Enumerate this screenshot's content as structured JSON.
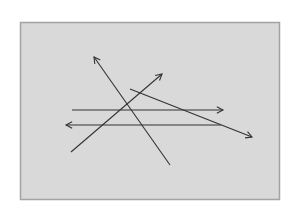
{
  "diagram": {
    "type": "arrows-on-panel",
    "panel": {
      "x": 20,
      "y": 22,
      "width": 259,
      "height": 177,
      "fill": "#d9d9d9",
      "stroke": "#a3a3a3"
    },
    "stroke_color": "#333333",
    "arrows": [
      {
        "id": "diagonal-up-left",
        "from": [
          170,
          165
        ],
        "to": [
          94,
          57
        ],
        "head": "end"
      },
      {
        "id": "diagonal-up-right",
        "from": [
          71,
          152
        ],
        "to": [
          162,
          74
        ],
        "head": "end"
      },
      {
        "id": "shallow-down-right",
        "from": [
          130,
          89
        ],
        "to": [
          252,
          137
        ],
        "head": "end"
      },
      {
        "id": "horizontal-right",
        "from": [
          72,
          110
        ],
        "to": [
          223,
          110
        ],
        "head": "end"
      },
      {
        "id": "horizontal-left",
        "from": [
          221,
          125
        ],
        "to": [
          66,
          125
        ],
        "head": "end"
      }
    ]
  }
}
